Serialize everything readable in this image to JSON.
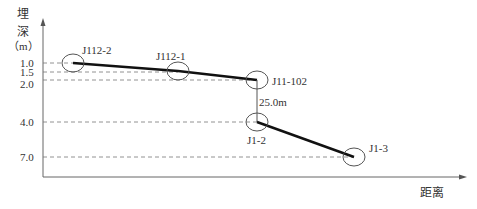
{
  "y_axis": {
    "label_line1": "埋",
    "label_line2": "深",
    "label_line3": "（m）",
    "ticks": [
      {
        "value": "1.0",
        "y": 63
      },
      {
        "value": "1.5",
        "y": 72
      },
      {
        "value": "2.0",
        "y": 80
      },
      {
        "value": "4.0",
        "y": 122
      },
      {
        "value": "7.0",
        "y": 157
      }
    ]
  },
  "x_axis": {
    "label": "距离"
  },
  "nodes": [
    {
      "id": "J112-2",
      "depth": 1.0,
      "label": "J112-2"
    },
    {
      "id": "J112-1",
      "depth": 1.5,
      "label": "J112-1"
    },
    {
      "id": "J11-102",
      "depth": 2.0,
      "label": "J11-102"
    },
    {
      "id": "J1-2",
      "depth": 4.0,
      "label": "J1-2"
    },
    {
      "id": "J1-3",
      "depth": 7.0,
      "label": "J1-3"
    }
  ],
  "annotation": {
    "drop_label": "25.0m"
  },
  "colors": {
    "pipe": "#111111",
    "axis": "#666666",
    "dashed": "#777777",
    "circle": "#555555"
  }
}
